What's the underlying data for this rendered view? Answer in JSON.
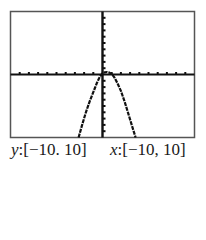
{
  "chart_data": {
    "type": "line",
    "title": "",
    "xlabel": "",
    "ylabel": "",
    "xlim": [
      -10,
      10
    ],
    "ylim": [
      -10,
      10
    ],
    "x_tick_step": 1,
    "y_tick_step": 1,
    "grid": false,
    "legend": "none",
    "series": [
      {
        "name": "graph",
        "x": [
          -2.6,
          -2.2,
          -1.8,
          -1.4,
          -1.0,
          -0.6,
          -0.3,
          0.0,
          0.25,
          0.5,
          0.75,
          1.0,
          1.3,
          1.6,
          2.0,
          2.4,
          2.8,
          3.2,
          3.6
        ],
        "y": [
          -10.0,
          -7.9,
          -6.0,
          -4.3,
          -2.8,
          -1.3,
          -0.4,
          0.2,
          0.35,
          0.4,
          0.3,
          0.1,
          -0.5,
          -1.3,
          -2.6,
          -4.3,
          -6.2,
          -8.1,
          -10.0
        ]
      }
    ],
    "window_labels": {
      "y": {
        "var": "y",
        "range": ":[−10. 10]"
      },
      "x": {
        "var": "x",
        "range": ":[−10, 10]"
      }
    }
  },
  "colors": {
    "frame": "#555555",
    "axes": "#111111",
    "curve": "#111111",
    "background": "#ffffff"
  }
}
